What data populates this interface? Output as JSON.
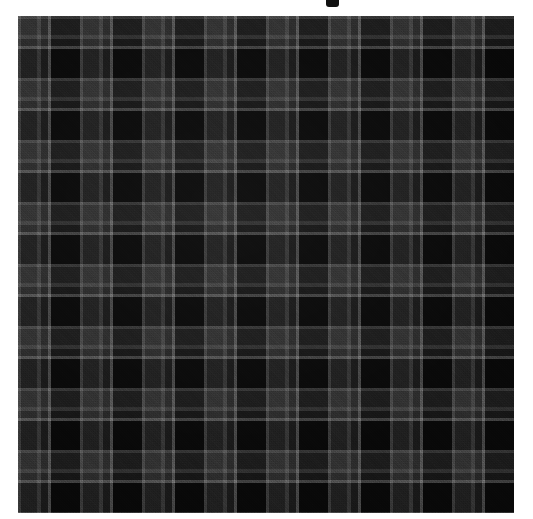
{
  "page": {
    "background_color": "#ffffff",
    "width": 533,
    "height": 519,
    "title_fragment": "",
    "title_note": "truncated glyph at top edge"
  },
  "swatch": {
    "label": "",
    "alt_text": "",
    "kind": "tartan-plaid-fabric",
    "x": 18,
    "y": 16,
    "width": 496,
    "height": 497,
    "sett_repeat_px": 62,
    "weave": "2/2 twill",
    "symmetric": true,
    "palette": {
      "ground_black": "#0a0a0a",
      "deep_black_block": "#090909",
      "dark_charcoal": "#1e1e1e",
      "mid_grey_band": "#343434",
      "grey_band_soft": "#2e2e2e",
      "grid_line_light": "#4e4e4e",
      "grid_line_pale": "#565656"
    },
    "sett_stripes": [
      {
        "start": 0,
        "end": 3,
        "color": "#4e4e4e",
        "name": "light-grid-line"
      },
      {
        "start": 3,
        "end": 19,
        "color": "#343434",
        "name": "mid-grey-band"
      },
      {
        "start": 19,
        "end": 23,
        "color": "#4e4e4e",
        "name": "light-grid-line"
      },
      {
        "start": 23,
        "end": 30,
        "color": "#2e2e2e",
        "name": "grey-band-soft"
      },
      {
        "start": 30,
        "end": 33,
        "color": "#565656",
        "name": "pale-tramline"
      },
      {
        "start": 33,
        "end": 62,
        "color": "#090909",
        "name": "deep-black-block"
      }
    ]
  }
}
